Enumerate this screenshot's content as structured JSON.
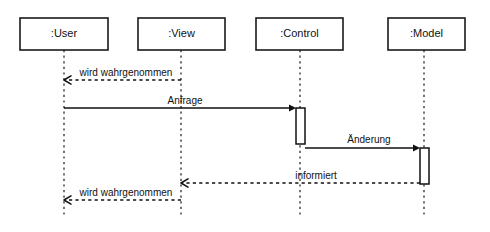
{
  "diagram": {
    "kind": "uml-sequence-diagram",
    "width": 490,
    "height": 232,
    "background_color": "#ffffff",
    "line_color": "#111111",
    "lifelines": [
      {
        "id": "user",
        "label": ":User",
        "box": {
          "x": 20,
          "y": 18,
          "width": 88,
          "height": 32
        },
        "axis_x": 64,
        "lifeline_top": 50,
        "lifeline_bottom": 218
      },
      {
        "id": "view",
        "label": ":View",
        "box": {
          "x": 138,
          "y": 18,
          "width": 87,
          "height": 32
        },
        "axis_x": 181,
        "lifeline_top": 50,
        "lifeline_bottom": 218
      },
      {
        "id": "control",
        "label": ":Control",
        "box": {
          "x": 256,
          "y": 18,
          "width": 87,
          "height": 32
        },
        "axis_x": 300,
        "lifeline_top": 50,
        "lifeline_bottom": 218
      },
      {
        "id": "model",
        "label": ":Model",
        "box": {
          "x": 388,
          "y": 18,
          "width": 77,
          "height": 32
        },
        "axis_x": 424,
        "lifeline_top": 50,
        "lifeline_bottom": 218
      }
    ],
    "activations": [
      {
        "id": "activation-control",
        "owner": "control",
        "x": 296,
        "y": 108,
        "width": 9,
        "height": 36
      },
      {
        "id": "activation-model",
        "owner": "model",
        "x": 420,
        "y": 148,
        "width": 9,
        "height": 36
      }
    ],
    "messages": [
      {
        "id": "msg-wird-wahrgenommen-1",
        "label": "wird wahrgenommen",
        "from": "view",
        "to": "user",
        "style": "dashed",
        "arrowhead": "open",
        "direction": "left",
        "x1": 181,
        "x2": 64,
        "y": 80,
        "label_x": 126,
        "label_y": 76
      },
      {
        "id": "msg-anfrage",
        "label": "Anfrage",
        "from": "user",
        "to": "control",
        "style": "solid",
        "arrowhead": "filled",
        "direction": "right",
        "x1": 64,
        "x2": 296,
        "y": 108,
        "label_x": 185,
        "label_y": 104
      },
      {
        "id": "msg-aenderung",
        "label": "Änderung",
        "from": "control",
        "to": "model",
        "style": "solid",
        "arrowhead": "filled",
        "direction": "right",
        "x1": 305,
        "x2": 420,
        "y": 148,
        "label_x": 369,
        "label_y": 143
      },
      {
        "id": "msg-informiert",
        "label": "informiert",
        "from": "model",
        "to": "view",
        "style": "dashed",
        "arrowhead": "open",
        "direction": "left",
        "x1": 420,
        "x2": 181,
        "y": 183,
        "label_x": 316,
        "label_y": 179
      },
      {
        "id": "msg-wird-wahrgenommen-2",
        "label": "wird wahrgenommen",
        "from": "view",
        "to": "user",
        "style": "dashed",
        "arrowhead": "open",
        "direction": "left",
        "x1": 181,
        "x2": 64,
        "y": 200,
        "label_x": 126,
        "label_y": 196
      }
    ]
  }
}
